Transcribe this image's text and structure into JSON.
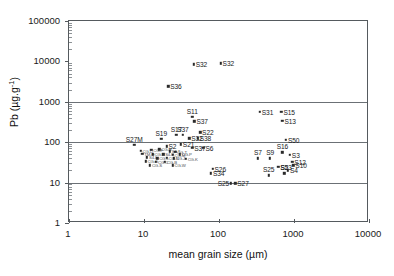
{
  "chart_data": {
    "type": "scatter",
    "title": "",
    "xlabel": "mean grain size (µm)",
    "ylabel_html": "Pb (µg.g",
    "ylabel_sup": "-1",
    "ylabel_tail": ")",
    "ylabel": "Pb (µg.g-1)",
    "xscale": "log",
    "yscale": "log",
    "xlim": [
      1,
      10000
    ],
    "ylim": [
      1,
      100000
    ],
    "xticks": [
      "1",
      "10",
      "100",
      "1000",
      "10000"
    ],
    "xtick_values": [
      1,
      10,
      100,
      1000,
      10000
    ],
    "yticks": [
      "1",
      "10",
      "100",
      "1000",
      "10000",
      "100000"
    ],
    "ytick_values": [
      1,
      10,
      100,
      1000,
      10000,
      100000
    ],
    "grid": "horizontal-major",
    "legend": "none",
    "marker": "square",
    "marker_color": "#2a2a2a",
    "points": [
      {
        "label": "S32",
        "x": 46,
        "y": 8500,
        "lpos": "right"
      },
      {
        "label": "S32",
        "x": 105,
        "y": 9000,
        "lpos": "right"
      },
      {
        "label": "S36",
        "x": 21,
        "y": 2400,
        "lpos": "right"
      },
      {
        "label": "S11",
        "x": 44,
        "y": 420,
        "lpos": "above"
      },
      {
        "label": "S37",
        "x": 47,
        "y": 330,
        "lpos": "right"
      },
      {
        "label": "S22",
        "x": 56,
        "y": 175,
        "lpos": "right"
      },
      {
        "label": "S17",
        "x": 27,
        "y": 150,
        "lpos": "above"
      },
      {
        "label": "S37",
        "x": 33,
        "y": 150,
        "lpos": "above"
      },
      {
        "label": "S19",
        "x": 17,
        "y": 120,
        "lpos": "above"
      },
      {
        "label": "S32",
        "x": 40,
        "y": 125,
        "lpos": "right"
      },
      {
        "label": "S38",
        "x": 52,
        "y": 125,
        "lpos": "right"
      },
      {
        "label": "S27M",
        "x": 7.4,
        "y": 85,
        "lpos": "above"
      },
      {
        "label": "S2",
        "x": 20,
        "y": 80,
        "lpos": "right"
      },
      {
        "label": "S21",
        "x": 31,
        "y": 88,
        "lpos": "right"
      },
      {
        "label": "S37",
        "x": 44,
        "y": 72,
        "lpos": "right"
      },
      {
        "label": "S6",
        "x": 62,
        "y": 72,
        "lpos": "right"
      },
      {
        "label": "S31",
        "x": 350,
        "y": 570,
        "lpos": "right"
      },
      {
        "label": "S15",
        "x": 680,
        "y": 570,
        "lpos": "right"
      },
      {
        "label": "S13",
        "x": 700,
        "y": 340,
        "lpos": "right"
      },
      {
        "label": "S50",
        "x": 780,
        "y": 115,
        "lpos": "right"
      },
      {
        "label": "S16",
        "x": 700,
        "y": 56,
        "lpos": "above"
      },
      {
        "label": "S3",
        "x": 880,
        "y": 48,
        "lpos": "right"
      },
      {
        "label": "S7",
        "x": 330,
        "y": 40,
        "lpos": "above"
      },
      {
        "label": "S9",
        "x": 480,
        "y": 40,
        "lpos": "above"
      },
      {
        "label": "S12",
        "x": 950,
        "y": 33,
        "lpos": "right"
      },
      {
        "label": "S10",
        "x": 980,
        "y": 27,
        "lpos": "right"
      },
      {
        "label": "S23",
        "x": 620,
        "y": 25,
        "lpos": "right"
      },
      {
        "label": "S4",
        "x": 830,
        "y": 20,
        "lpos": "right"
      },
      {
        "label": "S5",
        "x": 740,
        "y": 17,
        "lpos": "above"
      },
      {
        "label": "S25",
        "x": 460,
        "y": 15,
        "lpos": "above"
      },
      {
        "label": "S25",
        "x": 145,
        "y": 9.5,
        "lpos": "left"
      },
      {
        "label": "S27",
        "x": 165,
        "y": 9.5,
        "lpos": "right"
      },
      {
        "label": "S26",
        "x": 82,
        "y": 22,
        "lpos": "right"
      },
      {
        "label": "S34",
        "x": 78,
        "y": 17,
        "lpos": "right"
      }
    ],
    "cluster_points": [
      {
        "label": "CG-D",
        "x": 9.0,
        "y": 62
      },
      {
        "label": "CG-F",
        "x": 12.5,
        "y": 64
      },
      {
        "label": "CG-H",
        "x": 16.0,
        "y": 66
      },
      {
        "label": "S4-T",
        "x": 22.0,
        "y": 60
      },
      {
        "label": "CG-T",
        "x": 26.0,
        "y": 58
      },
      {
        "label": "TM-H",
        "x": 9.5,
        "y": 52
      },
      {
        "label": "CG-R",
        "x": 13.0,
        "y": 50
      },
      {
        "label": "S4-P",
        "x": 18.0,
        "y": 50
      },
      {
        "label": "CG-M",
        "x": 24.0,
        "y": 48
      },
      {
        "label": "CG-P",
        "x": 30.0,
        "y": 50
      },
      {
        "label": "S4-L",
        "x": 11.0,
        "y": 42
      },
      {
        "label": "CG-L",
        "x": 15.0,
        "y": 40
      },
      {
        "label": "CG-N",
        "x": 20.0,
        "y": 41
      },
      {
        "label": "CG-J",
        "x": 25.0,
        "y": 40
      },
      {
        "label": "CG-K",
        "x": 36.0,
        "y": 39
      },
      {
        "label": "CG-G",
        "x": 10.5,
        "y": 34
      },
      {
        "label": "CG-C",
        "x": 14.5,
        "y": 33
      },
      {
        "label": "CG-B",
        "x": 19.0,
        "y": 33
      },
      {
        "label": "CG-S",
        "x": 12.0,
        "y": 27
      },
      {
        "label": "CG-W",
        "x": 24.0,
        "y": 27
      }
    ]
  },
  "figure": {
    "background_color": "#ffffff",
    "frame_color": "#555a5e",
    "grid_color": "#6b7075"
  }
}
